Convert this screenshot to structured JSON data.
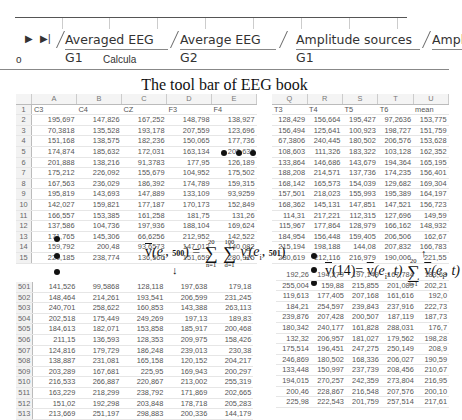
{
  "tabs": {
    "nav_next": "▶",
    "nav_last": "▶|",
    "items": [
      {
        "label": "Averaged EEG G1"
      },
      {
        "label": "Average EEG G2"
      },
      {
        "label": "Amplitude sources G1"
      },
      {
        "label": "Amplitude sources G2"
      }
    ]
  },
  "calc_row": {
    "left": "o",
    "label": "Calcula"
  },
  "caption": "The tool bar of EEG book",
  "left_sheet": {
    "col_letters": [
      "A",
      "B",
      "C",
      "D",
      "E"
    ],
    "headers": [
      "C3",
      "C4",
      "CZ",
      "F3",
      "F4"
    ],
    "rows": [
      {
        "n": "2",
        "v": [
          "195,697",
          "147,826",
          "167,252",
          "148,798",
          "138,927"
        ]
      },
      {
        "n": "3",
        "v": [
          "70,3818",
          "135,528",
          "193,178",
          "207,559",
          "123,696"
        ]
      },
      {
        "n": "4",
        "v": [
          "151,168",
          "138,575",
          "182,236",
          "150,065",
          "177,736"
        ]
      },
      {
        "n": "5",
        "v": [
          "174,874",
          "185,632",
          "172,031",
          "163,134",
          "202,632"
        ]
      },
      {
        "n": "6",
        "v": [
          "201,888",
          "138,216",
          "91,3783",
          "177,95",
          "126,189"
        ]
      },
      {
        "n": "7",
        "v": [
          "175,212",
          "226,092",
          "155,679",
          "104,952",
          "175,502"
        ]
      },
      {
        "n": "8",
        "v": [
          "167,563",
          "236,029",
          "186,392",
          "174,789",
          "159,315"
        ]
      },
      {
        "n": "9",
        "v": [
          "195,819",
          "143,693",
          "147,889",
          "133,109",
          "93,9259"
        ]
      },
      {
        "n": "10",
        "v": [
          "142,027",
          "159,821",
          "177,187",
          "170,173",
          "152,849"
        ]
      },
      {
        "n": "11",
        "v": [
          "166,557",
          "153,385",
          "161,258",
          "181,75",
          "131,26"
        ]
      },
      {
        "n": "12",
        "v": [
          "137,586",
          "104,736",
          "197,936",
          "188,104",
          "169,624"
        ]
      },
      {
        "n": "13",
        "v": [
          "171,765",
          "145,306",
          "66,6256",
          "212,952",
          "142,522"
        ]
      },
      {
        "n": "14",
        "v": [
          "159,792",
          "200,48",
          "93,6573",
          "147,012",
          "140,082"
        ]
      },
      {
        "n": "15",
        "v": [
          "220,185",
          "238,774",
          "136,566",
          "151,659",
          "280,915"
        ]
      }
    ]
  },
  "right_sheet": {
    "col_letters": [
      "Q",
      "R",
      "S",
      "T",
      "U"
    ],
    "headers": [
      "T3",
      "T4",
      "T5",
      "T6",
      "mean"
    ],
    "rows": [
      {
        "v": [
          "128,429",
          "156,664",
          "195,427",
          "97,2636",
          "153,775"
        ]
      },
      {
        "v": [
          "156,494",
          "125,641",
          "100,923",
          "198,727",
          "151,759"
        ]
      },
      {
        "v": [
          "67,3806",
          "240,445",
          "180,502",
          "206,576",
          "153,628"
        ]
      },
      {
        "v": [
          "108,603",
          "111,326",
          "183,322",
          "103,128",
          "162,352"
        ]
      },
      {
        "v": [
          "133,864",
          "146,686",
          "143,679",
          "194,364",
          "165,195"
        ]
      },
      {
        "v": [
          "188,208",
          "214,571",
          "137,736",
          "174,235",
          "156,401"
        ]
      },
      {
        "v": [
          "168,142",
          "165,573",
          "154,039",
          "129,682",
          "169,304"
        ]
      },
      {
        "v": [
          "157,501",
          "218,023",
          "155,993",
          "195,389",
          "164,197"
        ]
      },
      {
        "v": [
          "168,362",
          "145,131",
          "147,851",
          "147,521",
          "156,723"
        ]
      },
      {
        "v": [
          "114,31",
          "217,221",
          "112,315",
          "127,696",
          "149,59"
        ]
      },
      {
        "v": [
          "115,967",
          "177,864",
          "128,979",
          "166,162",
          "148,932"
        ]
      },
      {
        "v": [
          "184,954",
          "156,448",
          "159,405",
          "206,506",
          "162,67"
        ]
      },
      {
        "v": [
          "215,194",
          "198,188",
          "144,08",
          "207,832",
          "166,783"
        ]
      },
      {
        "v": [
          "280,619",
          "212,116",
          "216,979",
          "190,006",
          "221,55"
        ]
      }
    ]
  },
  "bottom_left_sheet": {
    "rows": [
      {
        "n": "501",
        "v": [
          "141,526",
          "99,5868",
          "128,118",
          "197,638",
          "179,18"
        ]
      },
      {
        "n": "502",
        "v": [
          "148,464",
          "214,261",
          "193,541",
          "206,599",
          "231,245"
        ]
      },
      {
        "n": "503",
        "v": [
          "240,701",
          "258,622",
          "160,853",
          "143,388",
          "263,113"
        ]
      },
      {
        "n": "504",
        "v": [
          "202,518",
          "175,449",
          "249,269",
          "197,13",
          "189,83"
        ]
      },
      {
        "n": "505",
        "v": [
          "184,613",
          "182,071",
          "153,858",
          "185,917",
          "200,468"
        ]
      },
      {
        "n": "506",
        "v": [
          "211,15",
          "136,593",
          "128,353",
          "209,975",
          "158,426"
        ]
      },
      {
        "n": "507",
        "v": [
          "124,816",
          "179,729",
          "186,248",
          "239,013",
          "230,38"
        ]
      },
      {
        "n": "508",
        "v": [
          "138,887",
          "231,081",
          "165,158",
          "120,152",
          "204,217"
        ]
      },
      {
        "n": "509",
        "v": [
          "203,289",
          "167,681",
          "225,95",
          "169,943",
          "200,297"
        ]
      },
      {
        "n": "510",
        "v": [
          "216,533",
          "266,887",
          "220,867",
          "213,002",
          "255,319"
        ]
      },
      {
        "n": "511",
        "v": [
          "163,229",
          "218,299",
          "238,792",
          "171,869",
          "202,665"
        ]
      },
      {
        "n": "512",
        "v": [
          "151,02",
          "192,298",
          "203,848",
          "178,718",
          "205,283"
        ]
      },
      {
        "n": "513",
        "v": [
          "213,669",
          "251,197",
          "298,883",
          "200,336",
          "144,179"
        ]
      }
    ]
  },
  "bottom_right_sheet": {
    "rows": [
      {
        "v": [
          "192,26",
          "194,279",
          "197,149",
          "167,784",
          "183,68"
        ]
      },
      {
        "v": [
          "255,004",
          "159,88",
          "215,855",
          "201,089",
          "202,21"
        ]
      },
      {
        "v": [
          "119,613",
          "177,405",
          "207,168",
          "161,616",
          "192,0"
        ]
      },
      {
        "v": [
          "184,21",
          "254,597",
          "239,843",
          "237,916",
          "222,73"
        ]
      },
      {
        "v": [
          "239,876",
          "207,428",
          "200,507",
          "187,119",
          "187,73"
        ]
      },
      {
        "v": [
          "180,342",
          "240,177",
          "161,828",
          "288,031",
          "176,7"
        ]
      },
      {
        "v": [
          "132,32",
          "206,957",
          "181,027",
          "179,562",
          "198,28"
        ]
      },
      {
        "v": [
          "175,514",
          "196,451",
          "247,275",
          "250,149",
          "208,9"
        ]
      },
      {
        "v": [
          "246,869",
          "180,502",
          "168,336",
          "206,027",
          "190,59"
        ]
      },
      {
        "v": [
          "133,448",
          "150,997",
          "237,739",
          "208,456",
          "210,67"
        ]
      },
      {
        "v": [
          "194,015",
          "270,257",
          "242,359",
          "273,804",
          "216,95"
        ]
      },
      {
        "v": [
          "200,46",
          "228,867",
          "216,548",
          "207,576",
          "200,10"
        ]
      },
      {
        "v": [
          "225,98",
          "222,543",
          "201,759",
          "257,514",
          "217,61"
        ]
      }
    ]
  },
  "formulas": {
    "f1": {
      "lhs_v": "v",
      "lhs_args_open": "(e",
      "lhs_sub": "i",
      "lhs_comma": ", ",
      "lhs_t": "500",
      "lhs_close": ")",
      "eq": " = ",
      "sum1_top": "20",
      "sum1_bot": "n=1",
      "sum2_top": "100",
      "sum2_bot": "d=1",
      "rhs_v": "v",
      "rhs_sup": "d",
      "rhs_sub": "n",
      "rhs_args_open": "(e",
      "rhs_sub2": "i",
      "rhs_comma": ", ",
      "rhs_t": "501",
      "rhs_close": ")"
    },
    "f2": {
      "lhs_v": "v",
      "lhs_arg": "(14)",
      "eq": "= ",
      "mid_v": "v",
      "mid_args": "(e",
      "mid_sub": "i",
      "mid_tail": ", t)",
      "sum_top": "20",
      "sum_bot": "i=1",
      "rhs_v": "v",
      "rhs_args": "(e",
      "rhs_sub": "i",
      "rhs_tail": ", t)"
    },
    "arrow_down": "↓",
    "arrow_up": "↑"
  }
}
